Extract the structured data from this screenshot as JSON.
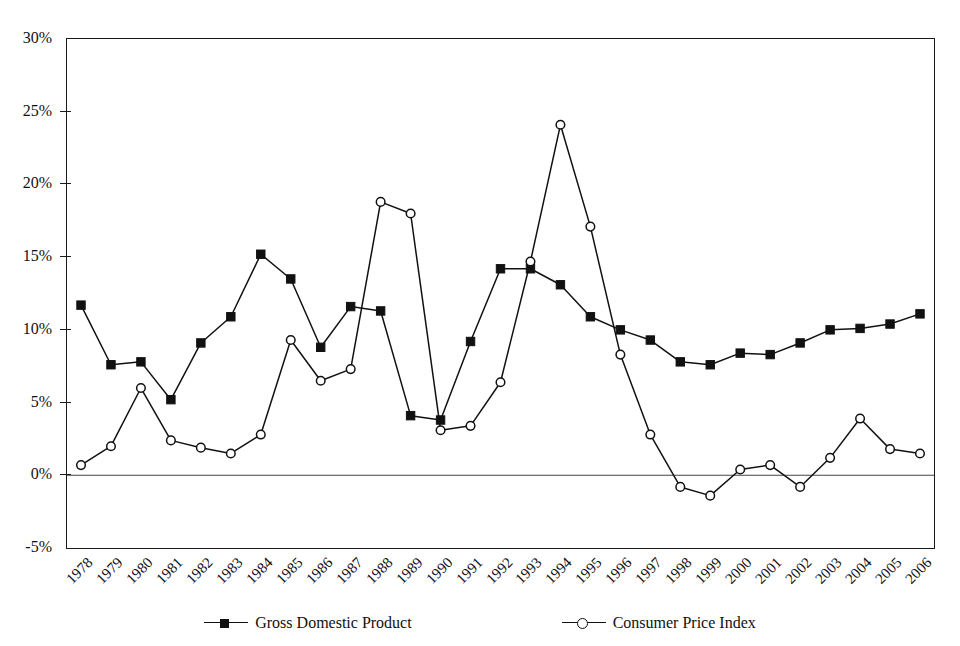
{
  "chart_data": {
    "type": "line",
    "title": "",
    "subtitle": "",
    "xlabel": "",
    "ylabel": "",
    "x": [
      1978,
      1979,
      1980,
      1981,
      1982,
      1983,
      1984,
      1985,
      1986,
      1987,
      1988,
      1989,
      1990,
      1991,
      1992,
      1993,
      1994,
      1995,
      1996,
      1997,
      1998,
      1999,
      2000,
      2001,
      2002,
      2003,
      2004,
      2005,
      2006
    ],
    "categories": [
      "1978",
      "1979",
      "1980",
      "1981",
      "1982",
      "1983",
      "1984",
      "1985",
      "1986",
      "1987",
      "1988",
      "1989",
      "1990",
      "1991",
      "1992",
      "1993",
      "1994",
      "1995",
      "1996",
      "1997",
      "1998",
      "1999",
      "2000",
      "2001",
      "2002",
      "2003",
      "2004",
      "2005",
      "2006"
    ],
    "series": [
      {
        "name": "Gross Domestic Product",
        "marker": "filled-square",
        "color": "#111111",
        "values": [
          11.7,
          7.6,
          7.8,
          5.2,
          9.1,
          10.9,
          15.2,
          13.5,
          8.8,
          11.6,
          11.3,
          4.1,
          3.8,
          9.2,
          14.2,
          14.2,
          13.1,
          10.9,
          10.0,
          9.3,
          7.8,
          7.6,
          8.4,
          8.3,
          9.1,
          10.0,
          10.1,
          10.4,
          11.1
        ]
      },
      {
        "name": "Consumer Price Index",
        "marker": "open-circle",
        "color": "#111111",
        "values": [
          0.7,
          2.0,
          6.0,
          2.4,
          1.9,
          1.5,
          2.8,
          9.3,
          6.5,
          7.3,
          18.8,
          18.0,
          3.1,
          3.4,
          6.4,
          14.7,
          24.1,
          17.1,
          8.3,
          2.8,
          -0.8,
          -1.4,
          0.4,
          0.7,
          -0.8,
          1.2,
          3.9,
          1.8,
          1.5
        ]
      }
    ],
    "ylim": [
      -5,
      30
    ],
    "yticks": [
      -5,
      0,
      5,
      10,
      15,
      20,
      25,
      30
    ],
    "ytick_labels": [
      "-5%",
      "0%",
      "5%",
      "10%",
      "15%",
      "20%",
      "25%",
      "30%"
    ],
    "grid": false,
    "zero_line": true,
    "legend_position": "bottom",
    "axis_frame": "box",
    "x_label_rotation": -45
  },
  "legend": {
    "entries": [
      {
        "label": "Gross Domestic Product",
        "marker": "filled-square-icon"
      },
      {
        "label": "Consumer Price Index",
        "marker": "open-circle-icon"
      }
    ]
  },
  "style": {
    "line_color": "#111111",
    "frame_color": "#1a1a1a",
    "background": "#ffffff"
  }
}
